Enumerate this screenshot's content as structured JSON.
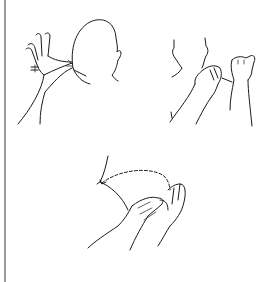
{
  "figure": {
    "panels": [
      {
        "id": "top-left",
        "content": "Back of head with open hand reaching to neck, double-line marks on wrist"
      },
      {
        "id": "top-right",
        "content": "Neck with one hand cupped at throat and another hand in fist/thumb gesture"
      },
      {
        "id": "bottom-center",
        "content": "Two cupped hands with dashed arc arrow toward shoulder"
      }
    ],
    "border": {
      "side": "left",
      "color": "#555555"
    },
    "line_color": "#1a1a1a"
  }
}
